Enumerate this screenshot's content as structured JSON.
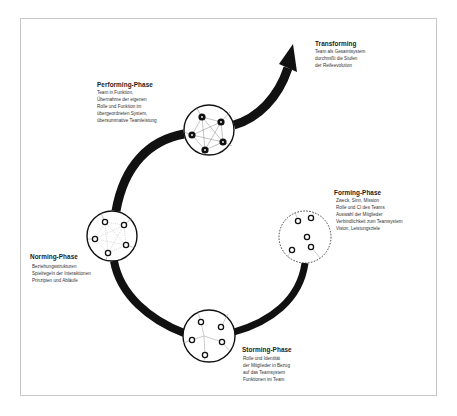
{
  "diagram": {
    "type": "team-development-spiral",
    "colors": {
      "curve": "#111111",
      "frame": "#c8c8c8",
      "node_fill_performing": "#111111",
      "link_line": "#999999",
      "background": "#ffffff"
    },
    "phases": {
      "transforming": {
        "title": "Transforming",
        "lines": [
          "Team als Gesamtsystem",
          "durchmißt die Stufen",
          "der Reifeevolution"
        ]
      },
      "performing": {
        "title": "Performing-Phase",
        "lines": [
          "Team in Funktion,",
          "Übernahme der eigenen",
          "Rolle und Funktion im",
          "übergeordneten System,",
          "übersummative Teamleistung"
        ]
      },
      "forming": {
        "title": "Forming-Phase",
        "lines": [
          "Zweck, Sinn, Mission",
          "Rolle und CI des Teams",
          "Auswahl der Mitglieder",
          "Verbindlichkeit zum Teamsystem",
          "Vision, Leistungsziele"
        ]
      },
      "norming": {
        "title": "Norming-Phase",
        "lines": [
          "Beziehungsstrukturen",
          "Spielregeln der Interaktionen",
          "Prinzipien und Abläufe"
        ]
      },
      "storming": {
        "title": "Storming-Phase",
        "lines": [
          "Rolle und Identität",
          "der Mitglieder in Bezug",
          "auf das Teamsystem",
          "Funktionen im Team"
        ]
      }
    },
    "nodes": {
      "forming_circle": "dashed circle, 5 loose hollow members",
      "storming_circle": "solid circle, 5 hollow members, sparse links",
      "norming_circle": "solid circle, 5 hollow members, dotted network",
      "performing_circle": "solid circle, 5 filled members, full network"
    },
    "icons": {
      "arrow": "arrow-up-right-icon",
      "member": "team-member-icon"
    }
  }
}
